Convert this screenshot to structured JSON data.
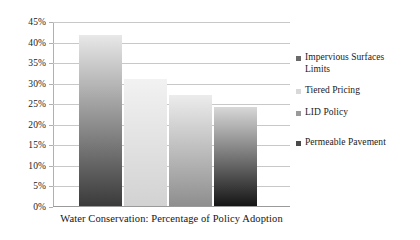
{
  "chart_data": {
    "type": "bar",
    "title": "",
    "caption": "Water Conservation: Percentage of Policy Adoption",
    "xlabel": "Water Conservation: Percentage of Policy Adoption",
    "ylabel": "",
    "categories": [
      "Impervious Surfaces Limits",
      "Tiered Pricing",
      "LID Policy",
      "Permeable Pavement"
    ],
    "values": [
      41.5,
      31.0,
      27.0,
      24.0
    ],
    "ylim": [
      0,
      45
    ],
    "ytick_step": 5,
    "ytick_labels": [
      "45%",
      "40%",
      "35%",
      "30%",
      "25%",
      "20%",
      "15%",
      "10%",
      "5%",
      "0%"
    ],
    "ytick_values": [
      45,
      40,
      35,
      30,
      25,
      20,
      15,
      10,
      5,
      0
    ],
    "grid": true,
    "legend_position": "right",
    "series": [
      {
        "name": "Impervious Surfaces Limits",
        "value": 41.5,
        "color_top": "#e8e8e8",
        "color_bottom": "#3a3a3a",
        "swatch": "#6a6a6a"
      },
      {
        "name": "Tiered Pricing",
        "value": 31.0,
        "color_top": "#f2f2f2",
        "color_bottom": "#d2d2d2",
        "swatch": "#d8d8d8"
      },
      {
        "name": "LID Policy",
        "value": 27.0,
        "color_top": "#ececec",
        "color_bottom": "#8e8e8e",
        "swatch": "#9a9a9a"
      },
      {
        "name": "Permeable Pavement",
        "value": 24.0,
        "color_top": "#d8d8d8",
        "color_bottom": "#151515",
        "swatch": "#4a4a4a"
      }
    ]
  },
  "legend": {
    "entries": [
      {
        "label": "Impervious Surfaces\nLimits"
      },
      {
        "label": "Tiered Pricing"
      },
      {
        "label": "LID Policy"
      },
      {
        "label": "Permeable Pavement"
      }
    ]
  },
  "axis": {
    "y_labels": [
      "45%",
      "40%",
      "35%",
      "30%",
      "25%",
      "20%",
      "15%",
      "10%",
      "5%",
      "0%"
    ]
  },
  "caption": {
    "text": "Water Conservation: Percentage of Policy Adoption"
  }
}
